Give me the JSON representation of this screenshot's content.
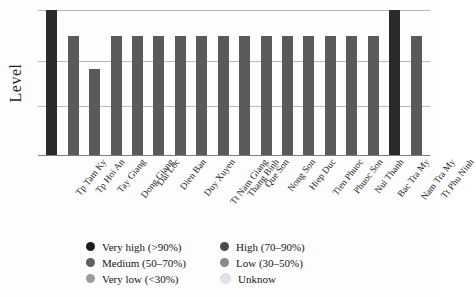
{
  "chart_data": {
    "type": "bar",
    "title": "",
    "subtitle": "",
    "xlabel": "",
    "ylabel": "Level",
    "ylim": [
      0,
      100
    ],
    "grid": true,
    "gridline_values": [
      100,
      65,
      34
    ],
    "y_tick_labels": [],
    "legend_position": "bottom-center",
    "categories": [
      "Tp Tam Ky",
      "Tp Hoi An",
      "Tay Giang",
      "Dong Giang",
      "Dai Loc",
      "Dien Ban",
      "Duy Xuyen",
      "Tt Nam Giang",
      "Thang Binh",
      "Que Son",
      "Nong Son",
      "Hiep Duc",
      "Tien Phuoc",
      "Phuoc Son",
      "Nui Thanh",
      "Bac Tra My",
      "Nam Tra My",
      "Tt Phu Ninh"
    ],
    "values": [
      100,
      82,
      59,
      82,
      82,
      82,
      82,
      82,
      82,
      82,
      82,
      82,
      82,
      82,
      82,
      82,
      100,
      82
    ],
    "series": [
      {
        "name": "Level",
        "values": [
          100,
          82,
          59,
          82,
          82,
          82,
          82,
          82,
          82,
          82,
          82,
          82,
          82,
          82,
          82,
          82,
          100,
          82
        ]
      }
    ],
    "bar_categories": [
      "Very high (>90%)",
      "High (70-90%)",
      "Medium (50-70%)",
      "High (70-90%)",
      "High (70-90%)",
      "High (70-90%)",
      "High (70-90%)",
      "High (70-90%)",
      "High (70-90%)",
      "High (70-90%)",
      "High (70-90%)",
      "High (70-90%)",
      "High (70-90%)",
      "High (70-90%)",
      "High (70-90%)",
      "High (70-90%)",
      "Very high (>90%)",
      "High (70-90%)"
    ],
    "bar_colors": [
      "#2b2b2b",
      "#5a5a5a",
      "#5a5a5a",
      "#5a5a5a",
      "#5a5a5a",
      "#5a5a5a",
      "#5a5a5a",
      "#5a5a5a",
      "#5a5a5a",
      "#5a5a5a",
      "#5a5a5a",
      "#5a5a5a",
      "#5a5a5a",
      "#5a5a5a",
      "#5a5a5a",
      "#5a5a5a",
      "#2b2b2b",
      "#5a5a5a"
    ]
  },
  "axis": {
    "y_title": "Level"
  },
  "legend": {
    "left_column": [
      {
        "label": "Very high (>90%)",
        "color": "#1e1e1e"
      },
      {
        "label": "Medium (50–70%)",
        "color": "#5f5f5f"
      },
      {
        "label": "Very low (<30%)",
        "color": "#9b9b9b"
      }
    ],
    "right_column": [
      {
        "label": "High (70–90%)",
        "color": "#4a4a4a"
      },
      {
        "label": "Low (30–50%)",
        "color": "#8a8a8a"
      },
      {
        "label": "Unknow",
        "color": "#e3e3e3"
      }
    ]
  },
  "colors": {
    "background": "#fdfdfd",
    "gridline": "#b9b9b9",
    "axis": "#7d7d7d",
    "text": "#1a1a1a"
  }
}
